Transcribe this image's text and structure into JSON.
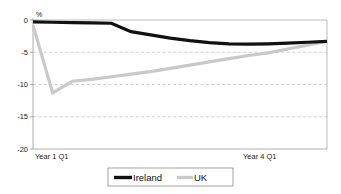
{
  "chart_data": {
    "type": "line",
    "title": "",
    "subtitle": "",
    "xlabel": "",
    "ylabel": "%",
    "axis_unit": "%",
    "ylim": [
      -20,
      0
    ],
    "yticks": [
      0,
      -5,
      -10,
      -15,
      -20
    ],
    "ytick_labels": [
      "0",
      "-5",
      "-10",
      "-15",
      "-20"
    ],
    "grid": true,
    "grid_axis": "y",
    "gridlines_at": [
      -5,
      -10,
      -15
    ],
    "legend_position": "bottom-center",
    "x": [
      0,
      1,
      2,
      3,
      4,
      5,
      6,
      7,
      8,
      9,
      10,
      11,
      12,
      13,
      14,
      15
    ],
    "xtick_labels": [
      "Year 1 Q1",
      "Year 4 Q1"
    ],
    "xtick_positions": [
      0,
      12
    ],
    "xtick_label_left": "Year 1 Q1",
    "xtick_label_right": "Year 4 Q1",
    "series": [
      {
        "name": "Ireland",
        "color": "#111111",
        "linewidth": 3.2,
        "values": [
          -0.3,
          -0.35,
          -0.4,
          -0.45,
          -0.5,
          -1.8,
          -2.3,
          -2.8,
          -3.2,
          -3.5,
          -3.7,
          -3.75,
          -3.7,
          -3.6,
          -3.45,
          -3.3
        ]
      },
      {
        "name": "UK",
        "color": "#c9c9c9",
        "linewidth": 3.2,
        "values": [
          -0.8,
          -11.3,
          -9.5,
          -9.2,
          -8.8,
          -8.4,
          -8.0,
          -7.5,
          -7.0,
          -6.5,
          -6.0,
          -5.5,
          -5.1,
          -4.5,
          -3.9,
          -3.3
        ]
      }
    ]
  },
  "legend": {
    "items": [
      {
        "label": "Ireland",
        "swatch_color": "#111111"
      },
      {
        "label": "UK",
        "swatch_color": "#c9c9c9"
      }
    ]
  }
}
